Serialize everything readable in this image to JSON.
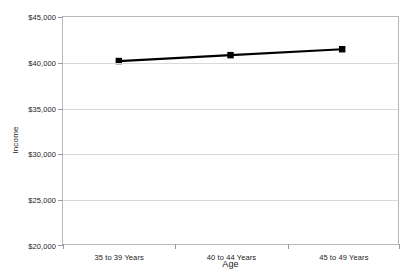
{
  "chart_data": {
    "type": "line",
    "title": "",
    "subtitle": "",
    "xlabel": "Age",
    "ylabel": "Income",
    "categories": [
      "35 to 39 Years",
      "40 to 44 Years",
      "45 to 49 Years"
    ],
    "series": [
      {
        "name": "Income",
        "values": [
          40150,
          40800,
          41450
        ],
        "color": "#000000",
        "marker": "square",
        "line_width": 2.2
      }
    ],
    "ylim": [
      20000,
      45000
    ],
    "y_ticks": [
      20000,
      25000,
      30000,
      35000,
      40000,
      45000
    ],
    "y_tick_labels": [
      "$20,000",
      "$25,000",
      "$30,000",
      "$35,000",
      "$40,000",
      "$45,000"
    ],
    "grid": {
      "horizontal": true,
      "vertical": false,
      "color": "#d9d9d9"
    },
    "legend": {
      "visible": false,
      "position": "none",
      "entries": []
    },
    "plot_border_color": "#b8b8b8",
    "background_color": "#ffffff",
    "annotations": []
  }
}
